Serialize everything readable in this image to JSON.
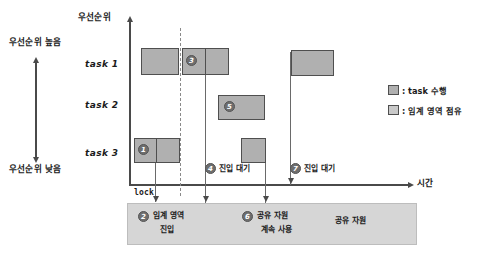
{
  "diagram": {
    "y_axis_label": "우선순위",
    "x_axis_label": "시간",
    "priority_high": "우선순위 높음",
    "priority_low": "우선순위 낮음",
    "lock_label": "lock"
  },
  "tasks": [
    {
      "label": "task 1"
    },
    {
      "label": "task 2"
    },
    {
      "label": "task 3"
    }
  ],
  "markers": {
    "m1": "1",
    "m2": "2",
    "m3": "3",
    "m4": "4",
    "m5": "5",
    "m6": "6",
    "m7": "7"
  },
  "annotations": {
    "entry_wait_1": "진입 대기",
    "entry_wait_2": "진입 대기"
  },
  "bottom_box": {
    "item1_line1": "임계 영역",
    "item1_line2": "진입",
    "item2_line1": "공유 자원",
    "item2_line2": "계속 사용",
    "item3": "공유 자원"
  },
  "legend": {
    "exec_label": ": task 수행",
    "crit_label": ": 임계 영역 점유",
    "exec_color": "#b0b0b0",
    "crit_color": "#c9c9c9"
  }
}
